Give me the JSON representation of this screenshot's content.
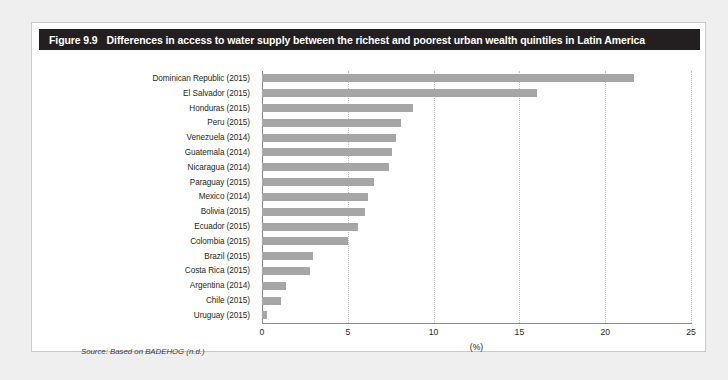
{
  "figure": {
    "number": "Figure 9.9",
    "title": "Differences in access to water supply between the richest and poorest urban wealth quintiles in Latin America",
    "source_note": "Source: Based on BADEHOG (n.d.)",
    "header_color": "#231f20",
    "bar_color": "#a6a6a6",
    "panel_background": "#ffffff",
    "page_background": "#efefef"
  },
  "chart_data": {
    "type": "bar",
    "orientation": "horizontal",
    "title": "Differences in access to water supply between the richest and poorest urban wealth quintiles in Latin America",
    "xlabel": "(%)",
    "ylabel": "",
    "xlim": [
      0,
      25
    ],
    "xticks": [
      0,
      5,
      10,
      15,
      20,
      25
    ],
    "xtick_labels": [
      "0",
      "5",
      "10",
      "15",
      "20",
      "25"
    ],
    "grid": "vertical-dotted",
    "legend": "none",
    "categories": [
      "Dominican Republic (2015)",
      "El Salvador (2015)",
      "Honduras (2015)",
      "Peru (2015)",
      "Venezuela (2014)",
      "Guatemala (2014)",
      "Nicaragua (2014)",
      "Paraguay (2015)",
      "Mexico (2014)",
      "Bolivia (2015)",
      "Ecuador (2015)",
      "Colombia (2015)",
      "Brazil (2015)",
      "Costa Rica (2015)",
      "Argentina (2014)",
      "Chile (2015)",
      "Uruguay (2015)"
    ],
    "values": [
      21.7,
      16.0,
      8.8,
      8.1,
      7.8,
      7.6,
      7.4,
      6.5,
      6.2,
      6.0,
      5.6,
      5.0,
      3.0,
      2.8,
      1.4,
      1.1,
      0.3
    ]
  }
}
